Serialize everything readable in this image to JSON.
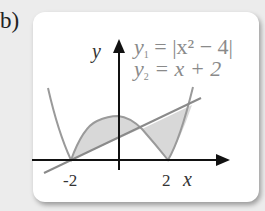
{
  "part_label": "b)",
  "equations": {
    "y1_name": "y",
    "y1_sub": "1",
    "y1_rhs": "= |x² − 4|",
    "y2_name": "y",
    "y2_sub": "2",
    "y2_rhs": "= x + 2"
  },
  "axes": {
    "x_label": "x",
    "y_label": "y"
  },
  "ticks": {
    "neg": "-2",
    "pos": "2"
  },
  "colors": {
    "curve": "#9a9a9a",
    "shade": "#d6d6d6",
    "axis": "#111111",
    "background": "#ececec",
    "card": "#ffffff"
  }
}
